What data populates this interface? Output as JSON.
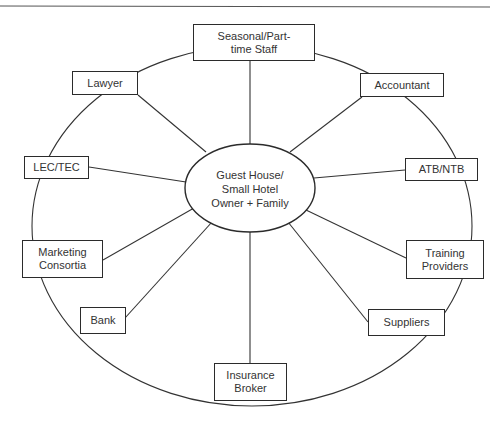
{
  "diagram": {
    "center": {
      "label": "Guest House/\nSmall Hotel\nOwner + Family"
    },
    "nodes": [
      {
        "id": "seasonal",
        "label": "Seasonal/Part-\ntime Staff"
      },
      {
        "id": "accountant",
        "label": "Accountant"
      },
      {
        "id": "atb-ntb",
        "label": "ATB/NTB"
      },
      {
        "id": "training",
        "label": "Training\nProviders"
      },
      {
        "id": "suppliers",
        "label": "Suppliers"
      },
      {
        "id": "insurance",
        "label": "Insurance\nBroker"
      },
      {
        "id": "bank",
        "label": "Bank"
      },
      {
        "id": "marketing",
        "label": "Marketing\nConsortia"
      },
      {
        "id": "lec-tec",
        "label": "LEC/TEC"
      },
      {
        "id": "lawyer",
        "label": "Lawyer"
      }
    ],
    "colors": {
      "line": "#2b2b2b",
      "background": "#ffffff",
      "text": "#333333"
    }
  }
}
